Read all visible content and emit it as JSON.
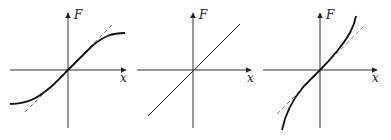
{
  "figure": {
    "panels": [
      {
        "id": "panel-1",
        "description": "saturating (softening) force curve with dashed linear tangent",
        "y_label": "F",
        "x_label": "x",
        "curve": "softening",
        "has_dashed_tangent": true
      },
      {
        "id": "panel-2",
        "description": "linear force",
        "y_label": "F",
        "x_label": "x",
        "curve": "linear",
        "has_dashed_tangent": false
      },
      {
        "id": "panel-3",
        "description": "stiffening force curve with dashed linear tangent",
        "y_label": "F",
        "x_label": "x",
        "curve": "hardening",
        "has_dashed_tangent": true
      }
    ],
    "colors": {
      "axis": "#333333",
      "curve": "#111111",
      "dashed": "#555555"
    }
  }
}
